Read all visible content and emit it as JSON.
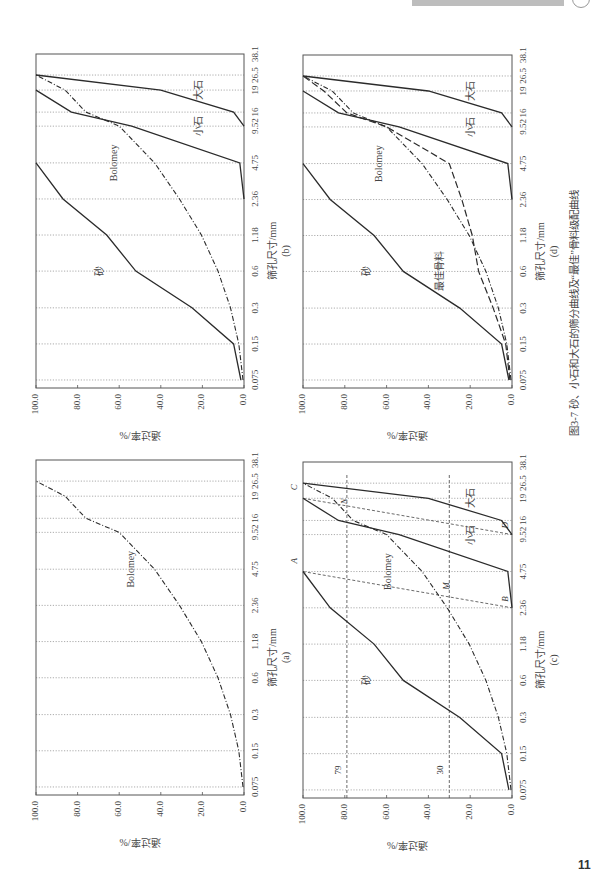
{
  "figure": {
    "caption": "图3-7  砂、小石和大石的筛分曲线及“最佳”骨料级配曲线",
    "page_number": "11"
  },
  "chart_data": [
    {
      "id": "a",
      "panel_label": "(a)",
      "type": "line",
      "title": "",
      "xlabel": "筛孔尺寸/mm",
      "ylabel": "通过率/%",
      "x": [
        "0.075",
        "0.15",
        "0.3",
        "0.6",
        "1.18",
        "2.36",
        "4.75",
        "9.52",
        "16",
        "19",
        "26.5",
        "38.1"
      ],
      "yticks": [
        "0.0",
        "20.0",
        "40.0",
        "60.0",
        "80.0",
        "100.0"
      ],
      "ylim": [
        0,
        100
      ],
      "grid": "vertical dotted at each sieve size",
      "series": [
        {
          "name": "Bolomey",
          "style": "dash-dot",
          "values": [
            0.5,
            2.5,
            6.5,
            12.5,
            20.5,
            31,
            43,
            60,
            76,
            86,
            100,
            null
          ]
        }
      ],
      "annotations": [
        {
          "text": "Bolomey",
          "at_x": "4.75",
          "at_y": 53
        }
      ]
    },
    {
      "id": "b",
      "panel_label": "(b)",
      "type": "line",
      "xlabel": "筛孔尺寸/mm",
      "ylabel": "通过率/%",
      "x": [
        "0.075",
        "0.15",
        "0.3",
        "0.6",
        "1.18",
        "2.36",
        "4.75",
        "9.52",
        "16",
        "19",
        "26.5",
        "38.1"
      ],
      "yticks": [
        "0.0",
        "20.0",
        "40.0",
        "60.0",
        "80.0",
        "100.0"
      ],
      "ylim": [
        0,
        100
      ],
      "series": [
        {
          "name": "砂",
          "style": "solid",
          "values": [
            1.5,
            5,
            25,
            52,
            66,
            87,
            100,
            null,
            null,
            null,
            null,
            null
          ]
        },
        {
          "name": "小石",
          "style": "solid",
          "values": [
            null,
            null,
            null,
            null,
            null,
            0,
            2,
            54,
            83,
            100,
            null,
            null
          ]
        },
        {
          "name": "大石",
          "style": "solid",
          "values": [
            null,
            null,
            null,
            null,
            null,
            null,
            null,
            0,
            5,
            40,
            100,
            null
          ]
        },
        {
          "name": "Bolomey",
          "style": "dash-dot",
          "values": [
            0.5,
            2.5,
            6.5,
            12.5,
            20.5,
            31,
            43,
            60,
            76,
            86,
            100,
            null
          ]
        }
      ],
      "annotations": [
        {
          "text": "砂",
          "at_x": "0.6",
          "at_y": 68
        },
        {
          "text": "Bolomey",
          "at_x": "4.75",
          "at_y": 61
        },
        {
          "text": "小石",
          "at_x": "9.52",
          "at_y": 20
        },
        {
          "text": "大石",
          "at_x": "19",
          "at_y": 20
        }
      ]
    },
    {
      "id": "c",
      "panel_label": "(c)",
      "type": "line",
      "xlabel": "筛孔尺寸/mm",
      "ylabel": "通过率/%",
      "x": [
        "0.075",
        "0.15",
        "0.3",
        "0.6",
        "1.18",
        "2.36",
        "4.75",
        "9.52",
        "16",
        "19",
        "26.5",
        "38.1"
      ],
      "yticks": [
        "0.0",
        "20.0",
        "40.0",
        "60.0",
        "80.0",
        "100.0"
      ],
      "ylim": [
        0,
        100
      ],
      "series": [
        {
          "name": "砂",
          "style": "solid",
          "values": [
            1.5,
            5,
            25,
            52,
            66,
            87,
            100,
            null,
            null,
            null,
            null,
            null
          ]
        },
        {
          "name": "小石",
          "style": "solid",
          "values": [
            null,
            null,
            null,
            null,
            null,
            0,
            2,
            54,
            83,
            100,
            null,
            null
          ]
        },
        {
          "name": "大石",
          "style": "solid",
          "values": [
            null,
            null,
            null,
            null,
            null,
            null,
            null,
            0,
            5,
            40,
            100,
            null
          ]
        },
        {
          "name": "Bolomey",
          "style": "dash-dot",
          "values": [
            0.5,
            2.5,
            6.5,
            12.5,
            20.5,
            31,
            43,
            60,
            76,
            86,
            100,
            null
          ]
        }
      ],
      "construction_lines": [
        {
          "name": "A-B",
          "from": {
            "x": "4.75",
            "y": 100
          },
          "to": {
            "x": "2.36",
            "y": 0
          }
        },
        {
          "name": "C-D",
          "from": {
            "x": "19",
            "y": 100
          },
          "to": {
            "x": "9.52",
            "y": 0
          }
        },
        {
          "name": "horizontal-79",
          "y": 79
        },
        {
          "name": "horizontal-30",
          "y": 30
        }
      ],
      "point_labels": [
        "A",
        "B",
        "C",
        "D",
        "M",
        "N"
      ],
      "reference_values": [
        "79",
        "30"
      ],
      "annotations": [
        {
          "text": "砂",
          "at_x": "0.6",
          "at_y": 68
        },
        {
          "text": "Bolomey",
          "at_x": "4.75",
          "at_y": 58
        },
        {
          "text": "小石",
          "at_x": "9.52",
          "at_y": 18
        },
        {
          "text": "大石",
          "at_x": "19",
          "at_y": 18
        }
      ]
    },
    {
      "id": "d",
      "panel_label": "(d)",
      "type": "line",
      "xlabel": "筛孔尺寸/mm",
      "ylabel": "通过率/%",
      "x": [
        "0.075",
        "0.15",
        "0.3",
        "0.6",
        "1.18",
        "2.36",
        "4.75",
        "9.52",
        "16",
        "19",
        "26.5",
        "38.1"
      ],
      "yticks": [
        "0.0",
        "20.0",
        "40.0",
        "60.0",
        "80.0",
        "100.0"
      ],
      "ylim": [
        0,
        100
      ],
      "series": [
        {
          "name": "砂",
          "style": "solid",
          "values": [
            1.5,
            5,
            25,
            52,
            66,
            87,
            100,
            null,
            null,
            null,
            null,
            null
          ]
        },
        {
          "name": "小石",
          "style": "solid",
          "values": [
            null,
            null,
            null,
            null,
            null,
            0,
            2,
            54,
            83,
            100,
            null,
            null
          ]
        },
        {
          "name": "大石",
          "style": "solid",
          "values": [
            null,
            null,
            null,
            null,
            null,
            null,
            null,
            0,
            5,
            40,
            100,
            null
          ]
        },
        {
          "name": "Bolomey",
          "style": "dash-dot",
          "values": [
            0.5,
            2.5,
            6.5,
            12.5,
            20.5,
            31,
            43,
            60,
            76,
            86,
            100,
            null
          ]
        },
        {
          "name": "最佳骨料",
          "style": "dashed",
          "values": [
            1,
            3,
            9,
            16,
            19,
            24,
            30,
            60,
            79,
            90,
            100,
            null
          ]
        }
      ],
      "annotations": [
        {
          "text": "砂",
          "at_x": "0.6",
          "at_y": 68
        },
        {
          "text": "Bolomey",
          "at_x": "4.75",
          "at_y": 62
        },
        {
          "text": "最佳骨料",
          "at_x": "0.6",
          "at_y": 33
        },
        {
          "text": "小石",
          "at_x": "9.52",
          "at_y": 18
        },
        {
          "text": "大石",
          "at_x": "19",
          "at_y": 18
        }
      ]
    }
  ]
}
